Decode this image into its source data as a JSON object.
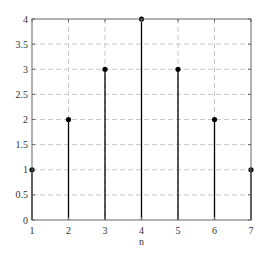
{
  "chart_data": {
    "type": "stem",
    "title": "",
    "xlabel": "n",
    "ylabel": "",
    "x": [
      1,
      2,
      3,
      4,
      5,
      6,
      7
    ],
    "values": [
      1,
      2,
      3,
      4,
      3,
      2,
      1
    ],
    "xlim": [
      1,
      7
    ],
    "ylim": [
      0,
      4
    ],
    "xticks": [
      "1",
      "2",
      "3",
      "4",
      "5",
      "6",
      "7"
    ],
    "yticks": [
      "0",
      "0.5",
      "1",
      "1.5",
      "2",
      "2.5",
      "3",
      "3.5",
      "4"
    ],
    "grid": true,
    "grid_style": "dashed",
    "legend": null,
    "colors": {
      "stem": "#000000",
      "marker": "#000000",
      "grid": "#c8c8c8",
      "axes": "#666666",
      "text": "#333333"
    }
  }
}
